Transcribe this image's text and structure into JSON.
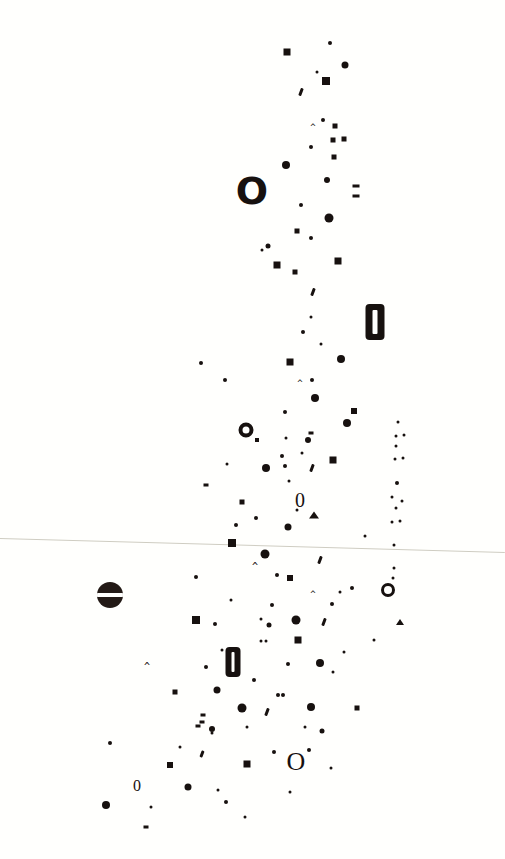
{
  "artwork": {
    "title": "Scatter Glyph Composition",
    "background_color": "#fffffd",
    "ink_color": "#17110f",
    "rule_color": "#cfcdc2",
    "width": 505,
    "height": 859,
    "horizon_line": {
      "name": "horizon-rule",
      "y_left": 538,
      "y_right": 552,
      "thickness": 1
    },
    "legend": {
      "dot": "filled-circle",
      "square": "filled-square",
      "ringfat": "bold-ring-glyph",
      "ringthin": "thin-ring-glyph",
      "barcircle": "circle-with-white-bar",
      "pill": "bold-zero-pill",
      "glyph": "typographic-character",
      "caret": "caret-mark",
      "comma": "comma-tick",
      "dash": "short-dash",
      "tri": "triangle-mark"
    },
    "marks": [
      {
        "t": "square",
        "x": 287,
        "y": 52,
        "w": 7,
        "h": 7
      },
      {
        "t": "dot",
        "x": 330,
        "y": 43,
        "w": 4,
        "h": 4
      },
      {
        "t": "dot",
        "x": 317,
        "y": 72,
        "w": 3,
        "h": 3
      },
      {
        "t": "dot",
        "x": 345,
        "y": 65,
        "w": 7,
        "h": 7
      },
      {
        "t": "square",
        "x": 326,
        "y": 81,
        "w": 8,
        "h": 8
      },
      {
        "t": "comma",
        "x": 301,
        "y": 92,
        "w": 3,
        "h": 8
      },
      {
        "t": "dot",
        "x": 323,
        "y": 120,
        "w": 4,
        "h": 4
      },
      {
        "t": "caret",
        "x": 313,
        "y": 127,
        "size": 9
      },
      {
        "t": "square",
        "x": 335,
        "y": 126,
        "w": 5,
        "h": 5
      },
      {
        "t": "square",
        "x": 333,
        "y": 140,
        "w": 5,
        "h": 5
      },
      {
        "t": "square",
        "x": 344,
        "y": 139,
        "w": 5,
        "h": 5
      },
      {
        "t": "dot",
        "x": 311,
        "y": 147,
        "w": 4,
        "h": 4
      },
      {
        "t": "square",
        "x": 334,
        "y": 157,
        "w": 5,
        "h": 5
      },
      {
        "t": "dot",
        "x": 286,
        "y": 165,
        "w": 8,
        "h": 8
      },
      {
        "t": "glyph",
        "x": 252,
        "y": 191,
        "ch": "O",
        "size": 38,
        "bold": true
      },
      {
        "t": "dot",
        "x": 327,
        "y": 180,
        "w": 6,
        "h": 6
      },
      {
        "t": "dash",
        "x": 356,
        "y": 186,
        "w": 7,
        "h": 3
      },
      {
        "t": "dash",
        "x": 356,
        "y": 196,
        "w": 7,
        "h": 3
      },
      {
        "t": "dot",
        "x": 301,
        "y": 205,
        "w": 4,
        "h": 4
      },
      {
        "t": "dot",
        "x": 329,
        "y": 218,
        "w": 9,
        "h": 9
      },
      {
        "t": "square",
        "x": 297,
        "y": 231,
        "w": 5,
        "h": 5
      },
      {
        "t": "dot",
        "x": 268,
        "y": 246,
        "w": 5,
        "h": 5
      },
      {
        "t": "dot",
        "x": 311,
        "y": 238,
        "w": 4,
        "h": 4
      },
      {
        "t": "dot",
        "x": 262,
        "y": 250,
        "w": 3,
        "h": 3
      },
      {
        "t": "square",
        "x": 277,
        "y": 265,
        "w": 7,
        "h": 7
      },
      {
        "t": "square",
        "x": 295,
        "y": 272,
        "w": 5,
        "h": 5
      },
      {
        "t": "square",
        "x": 338,
        "y": 261,
        "w": 7,
        "h": 7
      },
      {
        "t": "comma",
        "x": 313,
        "y": 292,
        "w": 3,
        "h": 8
      },
      {
        "t": "dot",
        "x": 311,
        "y": 317,
        "w": 3,
        "h": 3
      },
      {
        "t": "pill",
        "x": 375,
        "y": 322,
        "w": 19,
        "h": 36
      },
      {
        "t": "dot",
        "x": 303,
        "y": 332,
        "w": 4,
        "h": 4
      },
      {
        "t": "dot",
        "x": 321,
        "y": 344,
        "w": 3,
        "h": 3
      },
      {
        "t": "dot",
        "x": 201,
        "y": 363,
        "w": 4,
        "h": 4
      },
      {
        "t": "square",
        "x": 290,
        "y": 362,
        "w": 7,
        "h": 7
      },
      {
        "t": "dot",
        "x": 341,
        "y": 359,
        "w": 8,
        "h": 8
      },
      {
        "t": "dot",
        "x": 225,
        "y": 380,
        "w": 4,
        "h": 4
      },
      {
        "t": "caret",
        "x": 300,
        "y": 383,
        "size": 9
      },
      {
        "t": "dot",
        "x": 312,
        "y": 380,
        "w": 4,
        "h": 4
      },
      {
        "t": "dot",
        "x": 315,
        "y": 398,
        "w": 8,
        "h": 8
      },
      {
        "t": "dot",
        "x": 285,
        "y": 412,
        "w": 4,
        "h": 4
      },
      {
        "t": "square",
        "x": 354,
        "y": 411,
        "w": 6,
        "h": 6
      },
      {
        "t": "ringfat",
        "x": 246,
        "y": 430,
        "w": 15,
        "h": 15,
        "bw": 4
      },
      {
        "t": "dot",
        "x": 347,
        "y": 423,
        "w": 8,
        "h": 8
      },
      {
        "t": "dash",
        "x": 311,
        "y": 433,
        "w": 5,
        "h": 3
      },
      {
        "t": "dot",
        "x": 398,
        "y": 422,
        "w": 3,
        "h": 3
      },
      {
        "t": "square",
        "x": 257,
        "y": 440,
        "w": 4,
        "h": 4
      },
      {
        "t": "dot",
        "x": 308,
        "y": 440,
        "w": 6,
        "h": 6
      },
      {
        "t": "dot",
        "x": 396,
        "y": 436,
        "w": 3,
        "h": 3
      },
      {
        "t": "dot",
        "x": 404,
        "y": 435,
        "w": 3,
        "h": 3
      },
      {
        "t": "dot",
        "x": 396,
        "y": 446,
        "w": 3,
        "h": 3
      },
      {
        "t": "dot",
        "x": 282,
        "y": 456,
        "w": 4,
        "h": 4
      },
      {
        "t": "square",
        "x": 333,
        "y": 460,
        "w": 7,
        "h": 7
      },
      {
        "t": "dot",
        "x": 395,
        "y": 459,
        "w": 3,
        "h": 3
      },
      {
        "t": "dot",
        "x": 403,
        "y": 458,
        "w": 3,
        "h": 3
      },
      {
        "t": "dot",
        "x": 266,
        "y": 468,
        "w": 8,
        "h": 8
      },
      {
        "t": "dot",
        "x": 285,
        "y": 466,
        "w": 4,
        "h": 4
      },
      {
        "t": "comma",
        "x": 312,
        "y": 468,
        "w": 3,
        "h": 8
      },
      {
        "t": "dash",
        "x": 206,
        "y": 485,
        "w": 5,
        "h": 3
      },
      {
        "t": "dot",
        "x": 289,
        "y": 481,
        "w": 3,
        "h": 3
      },
      {
        "t": "dot",
        "x": 397,
        "y": 483,
        "w": 4,
        "h": 4
      },
      {
        "t": "glyph",
        "x": 300,
        "y": 500,
        "ch": "0",
        "size": 20,
        "bold": false
      },
      {
        "t": "square",
        "x": 242,
        "y": 502,
        "w": 5,
        "h": 5
      },
      {
        "t": "dot",
        "x": 392,
        "y": 497,
        "w": 3,
        "h": 3
      },
      {
        "t": "dot",
        "x": 402,
        "y": 501,
        "w": 3,
        "h": 3
      },
      {
        "t": "dot",
        "x": 396,
        "y": 508,
        "w": 3,
        "h": 3
      },
      {
        "t": "tri",
        "x": 314,
        "y": 515,
        "w": 11,
        "h": 7
      },
      {
        "t": "dot",
        "x": 256,
        "y": 518,
        "w": 4,
        "h": 4
      },
      {
        "t": "dot",
        "x": 297,
        "y": 510,
        "w": 3,
        "h": 3
      },
      {
        "t": "dot",
        "x": 236,
        "y": 525,
        "w": 4,
        "h": 4
      },
      {
        "t": "dot",
        "x": 392,
        "y": 522,
        "w": 3,
        "h": 3
      },
      {
        "t": "dot",
        "x": 400,
        "y": 521,
        "w": 3,
        "h": 3
      },
      {
        "t": "dot",
        "x": 288,
        "y": 527,
        "w": 7,
        "h": 7
      },
      {
        "t": "dot",
        "x": 365,
        "y": 536,
        "w": 3,
        "h": 3
      },
      {
        "t": "square",
        "x": 232,
        "y": 543,
        "w": 8,
        "h": 8
      },
      {
        "t": "dot",
        "x": 394,
        "y": 545,
        "w": 3,
        "h": 3
      },
      {
        "t": "dot",
        "x": 265,
        "y": 554,
        "w": 9,
        "h": 9
      },
      {
        "t": "caret",
        "x": 255,
        "y": 567,
        "size": 10
      },
      {
        "t": "comma",
        "x": 320,
        "y": 560,
        "w": 3,
        "h": 8
      },
      {
        "t": "dot",
        "x": 394,
        "y": 568,
        "w": 3,
        "h": 3
      },
      {
        "t": "dot",
        "x": 393,
        "y": 578,
        "w": 3,
        "h": 3
      },
      {
        "t": "dot",
        "x": 196,
        "y": 577,
        "w": 4,
        "h": 4
      },
      {
        "t": "dot",
        "x": 277,
        "y": 575,
        "w": 4,
        "h": 4
      },
      {
        "t": "square",
        "x": 290,
        "y": 578,
        "w": 6,
        "h": 6
      },
      {
        "t": "dot",
        "x": 352,
        "y": 588,
        "w": 4,
        "h": 4
      },
      {
        "t": "ringthin",
        "x": 388,
        "y": 590,
        "w": 14,
        "h": 14,
        "bw": 3
      },
      {
        "t": "barcircle",
        "x": 110,
        "y": 595,
        "w": 26,
        "h": 26
      },
      {
        "t": "caret",
        "x": 313,
        "y": 594,
        "size": 9
      },
      {
        "t": "dot",
        "x": 231,
        "y": 600,
        "w": 3,
        "h": 3
      },
      {
        "t": "dot",
        "x": 272,
        "y": 605,
        "w": 4,
        "h": 4
      },
      {
        "t": "dot",
        "x": 332,
        "y": 604,
        "w": 4,
        "h": 4
      },
      {
        "t": "square",
        "x": 196,
        "y": 620,
        "w": 8,
        "h": 8
      },
      {
        "t": "dot",
        "x": 215,
        "y": 624,
        "w": 4,
        "h": 4
      },
      {
        "t": "dot",
        "x": 269,
        "y": 625,
        "w": 5,
        "h": 5
      },
      {
        "t": "dot",
        "x": 296,
        "y": 620,
        "w": 9,
        "h": 9
      },
      {
        "t": "comma",
        "x": 324,
        "y": 622,
        "w": 3,
        "h": 8
      },
      {
        "t": "tri",
        "x": 400,
        "y": 622,
        "w": 9,
        "h": 6
      },
      {
        "t": "dot",
        "x": 261,
        "y": 619,
        "w": 3,
        "h": 3
      },
      {
        "t": "square",
        "x": 298,
        "y": 640,
        "w": 7,
        "h": 7
      },
      {
        "t": "dot",
        "x": 261,
        "y": 641,
        "w": 3,
        "h": 3
      },
      {
        "t": "dot",
        "x": 266,
        "y": 641,
        "w": 3,
        "h": 3
      },
      {
        "t": "dot",
        "x": 222,
        "y": 650,
        "w": 3,
        "h": 3
      },
      {
        "t": "pill",
        "x": 233,
        "y": 662,
        "w": 15,
        "h": 30
      },
      {
        "t": "caret",
        "x": 147,
        "y": 667,
        "size": 10
      },
      {
        "t": "dot",
        "x": 206,
        "y": 667,
        "w": 4,
        "h": 4
      },
      {
        "t": "dot",
        "x": 288,
        "y": 664,
        "w": 4,
        "h": 4
      },
      {
        "t": "dot",
        "x": 320,
        "y": 663,
        "w": 8,
        "h": 8
      },
      {
        "t": "dot",
        "x": 333,
        "y": 672,
        "w": 3,
        "h": 3
      },
      {
        "t": "dot",
        "x": 254,
        "y": 680,
        "w": 4,
        "h": 4
      },
      {
        "t": "square",
        "x": 175,
        "y": 692,
        "w": 5,
        "h": 5
      },
      {
        "t": "dot",
        "x": 217,
        "y": 690,
        "w": 7,
        "h": 7
      },
      {
        "t": "dot",
        "x": 278,
        "y": 695,
        "w": 4,
        "h": 4
      },
      {
        "t": "dot",
        "x": 283,
        "y": 695,
        "w": 4,
        "h": 4
      },
      {
        "t": "dot",
        "x": 242,
        "y": 708,
        "w": 9,
        "h": 9
      },
      {
        "t": "dot",
        "x": 311,
        "y": 707,
        "w": 8,
        "h": 8
      },
      {
        "t": "dash",
        "x": 203,
        "y": 715,
        "w": 5,
        "h": 3
      },
      {
        "t": "comma",
        "x": 267,
        "y": 712,
        "w": 3,
        "h": 8
      },
      {
        "t": "square",
        "x": 357,
        "y": 708,
        "w": 5,
        "h": 5
      },
      {
        "t": "dash",
        "x": 198,
        "y": 726,
        "w": 5,
        "h": 3
      },
      {
        "t": "dot",
        "x": 212,
        "y": 729,
        "w": 6,
        "h": 6
      },
      {
        "t": "dot",
        "x": 247,
        "y": 727,
        "w": 3,
        "h": 3
      },
      {
        "t": "dot",
        "x": 322,
        "y": 731,
        "w": 5,
        "h": 5
      },
      {
        "t": "dot",
        "x": 212,
        "y": 733,
        "w": 3,
        "h": 3
      },
      {
        "t": "dot",
        "x": 305,
        "y": 727,
        "w": 3,
        "h": 3
      },
      {
        "t": "dash",
        "x": 202,
        "y": 722,
        "w": 5,
        "h": 3
      },
      {
        "t": "dot",
        "x": 110,
        "y": 743,
        "w": 4,
        "h": 4
      },
      {
        "t": "dot",
        "x": 180,
        "y": 747,
        "w": 3,
        "h": 3
      },
      {
        "t": "comma",
        "x": 202,
        "y": 754,
        "w": 3,
        "h": 7
      },
      {
        "t": "square",
        "x": 247,
        "y": 764,
        "w": 7,
        "h": 7
      },
      {
        "t": "square",
        "x": 170,
        "y": 765,
        "w": 6,
        "h": 6
      },
      {
        "t": "dot",
        "x": 274,
        "y": 752,
        "w": 4,
        "h": 4
      },
      {
        "t": "glyph",
        "x": 296,
        "y": 762,
        "ch": "O",
        "size": 26,
        "bold": false
      },
      {
        "t": "dot",
        "x": 309,
        "y": 750,
        "w": 4,
        "h": 4
      },
      {
        "t": "dot",
        "x": 331,
        "y": 768,
        "w": 3,
        "h": 3
      },
      {
        "t": "glyph",
        "x": 137,
        "y": 786,
        "ch": "0",
        "size": 16,
        "bold": false
      },
      {
        "t": "dot",
        "x": 188,
        "y": 787,
        "w": 7,
        "h": 7
      },
      {
        "t": "dot",
        "x": 218,
        "y": 790,
        "w": 3,
        "h": 3
      },
      {
        "t": "dot",
        "x": 290,
        "y": 792,
        "w": 3,
        "h": 3
      },
      {
        "t": "dot",
        "x": 106,
        "y": 805,
        "w": 8,
        "h": 8
      },
      {
        "t": "dot",
        "x": 151,
        "y": 807,
        "w": 3,
        "h": 3
      },
      {
        "t": "dot",
        "x": 226,
        "y": 802,
        "w": 4,
        "h": 4
      },
      {
        "t": "dash",
        "x": 146,
        "y": 827,
        "w": 5,
        "h": 3
      },
      {
        "t": "dot",
        "x": 245,
        "y": 817,
        "w": 3,
        "h": 3
      },
      {
        "t": "dot",
        "x": 340,
        "y": 592,
        "w": 3,
        "h": 3
      },
      {
        "t": "dot",
        "x": 344,
        "y": 652,
        "w": 3,
        "h": 3
      },
      {
        "t": "dot",
        "x": 374,
        "y": 640,
        "w": 3,
        "h": 3
      },
      {
        "t": "dot",
        "x": 286,
        "y": 438,
        "w": 3,
        "h": 3
      },
      {
        "t": "dot",
        "x": 302,
        "y": 453,
        "w": 3,
        "h": 3
      },
      {
        "t": "dot",
        "x": 227,
        "y": 464,
        "w": 3,
        "h": 3
      }
    ]
  }
}
